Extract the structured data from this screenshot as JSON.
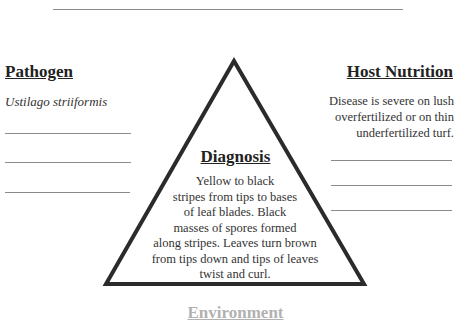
{
  "diagram": {
    "type": "disease-triangle",
    "pathogen": {
      "heading": "Pathogen",
      "value": "Ustilago striiformis",
      "blank_lines": 3
    },
    "host_nutrition": {
      "heading": "Host Nutrition",
      "lines": [
        "Disease is severe on lush",
        "overfertilized or on thin",
        "underfertilized turf."
      ],
      "blank_lines": 3
    },
    "diagnosis": {
      "heading": "Diagnosis",
      "lines": [
        "Yellow to black",
        "stripes from tips to bases",
        "of leaf blades.  Black",
        "masses of spores formed",
        "along stripes.  Leaves turn brown",
        "from tips down and tips of leaves",
        "twist and curl."
      ]
    },
    "environment": {
      "heading": "Environment"
    },
    "colors": {
      "triangle_stroke": "#2b2b2b",
      "rule": "#8a8a8a",
      "text": "#2a2a2a"
    }
  }
}
